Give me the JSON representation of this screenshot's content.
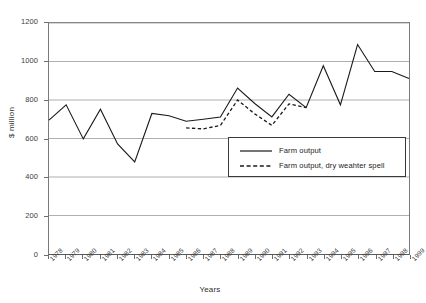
{
  "chart_data": {
    "type": "line",
    "title": "",
    "xlabel": "Years",
    "ylabel": "$ million",
    "ylim": [
      0,
      1200
    ],
    "ytick_step": 200,
    "yticks": [
      0,
      200,
      400,
      600,
      800,
      1000,
      1200
    ],
    "grid": true,
    "legend_position": "inside-lower-right",
    "categories": [
      "1978",
      "1979",
      "1980",
      "1981",
      "1982",
      "1983",
      "1984",
      "1985",
      "1986",
      "1987",
      "1988",
      "1989",
      "1990",
      "1991",
      "1992",
      "1993",
      "1994",
      "1995",
      "1996",
      "1997",
      "1998",
      "1999"
    ],
    "series": [
      {
        "name": "Farm output",
        "style": "solid",
        "values": [
          695,
          775,
          598,
          752,
          572,
          478,
          730,
          718,
          690,
          700,
          712,
          862,
          782,
          712,
          830,
          760,
          978,
          775,
          1088,
          948,
          948,
          912
        ]
      },
      {
        "name": "Farm output, dry weahter spell",
        "style": "dashed",
        "values": [
          null,
          null,
          null,
          null,
          null,
          null,
          null,
          null,
          655,
          650,
          668,
          800,
          728,
          668,
          780,
          760,
          null,
          null,
          null,
          null,
          null,
          null
        ]
      }
    ]
  },
  "yaxis": {
    "title": "$ million",
    "ticks": [
      "0",
      "200",
      "400",
      "600",
      "800",
      "1000",
      "1200"
    ]
  },
  "xaxis": {
    "title": "Years",
    "ticks": [
      "1978",
      "1979",
      "1980",
      "1981",
      "1982",
      "1983",
      "1984",
      "1985",
      "1986",
      "1987",
      "1988",
      "1989",
      "1990",
      "1991",
      "1992",
      "1993",
      "1994",
      "1995",
      "1996",
      "1997",
      "1998",
      "1999"
    ]
  },
  "legend": {
    "items": [
      {
        "label": "Farm output",
        "style": "solid"
      },
      {
        "label": "Farm output, dry weahter spell",
        "style": "dashed"
      }
    ]
  },
  "colors": {
    "line": "#1a1a1a",
    "grid": "#9a9a9a",
    "axis": "#5a5a5a",
    "background": "#ffffff",
    "text": "#2f2f2f"
  }
}
